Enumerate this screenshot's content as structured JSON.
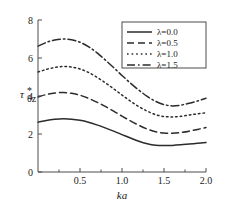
{
  "chart_data": {
    "type": "line",
    "title": "",
    "xlabel": "ka",
    "ylabel": "τ*θz",
    "xlim": [
      0.0,
      2.0
    ],
    "ylim": [
      0.0,
      8.0
    ],
    "xticks": [
      "0.5",
      "1.0",
      "1.5",
      "2.0"
    ],
    "xtick_values": [
      0.5,
      1.0,
      1.5,
      2.0
    ],
    "yticks": [
      "0",
      "2",
      "4",
      "6",
      "8"
    ],
    "ytick_values": [
      0,
      2,
      4,
      6,
      8
    ],
    "grid": false,
    "legend_position": "top-right",
    "x": [
      0.0,
      0.1,
      0.2,
      0.3,
      0.4,
      0.5,
      0.6,
      0.7,
      0.8,
      0.9,
      1.0,
      1.1,
      1.2,
      1.3,
      1.4,
      1.5,
      1.6,
      1.7,
      1.8,
      1.9,
      2.0
    ],
    "series": [
      {
        "name": "λ=0.0",
        "style": "solid",
        "values": [
          2.62,
          2.71,
          2.77,
          2.8,
          2.78,
          2.72,
          2.62,
          2.48,
          2.32,
          2.15,
          1.97,
          1.79,
          1.62,
          1.49,
          1.41,
          1.39,
          1.4,
          1.43,
          1.47,
          1.51,
          1.55
        ]
      },
      {
        "name": "λ=0.5",
        "style": "dashed",
        "values": [
          3.95,
          4.08,
          4.16,
          4.18,
          4.14,
          4.04,
          3.88,
          3.68,
          3.45,
          3.2,
          2.94,
          2.69,
          2.46,
          2.26,
          2.12,
          2.05,
          2.04,
          2.08,
          2.15,
          2.24,
          2.34
        ]
      },
      {
        "name": "λ=1.0",
        "style": "dotted",
        "values": [
          5.26,
          5.4,
          5.5,
          5.55,
          5.52,
          5.42,
          5.24,
          4.99,
          4.7,
          4.38,
          4.05,
          3.73,
          3.44,
          3.2,
          3.02,
          2.92,
          2.9,
          2.93,
          3.0,
          3.06,
          3.12
        ]
      },
      {
        "name": "λ=1.5",
        "style": "dashdot",
        "values": [
          6.62,
          6.82,
          6.95,
          7.0,
          6.96,
          6.83,
          6.6,
          6.28,
          5.9,
          5.5,
          5.08,
          4.68,
          4.31,
          3.98,
          3.72,
          3.55,
          3.48,
          3.52,
          3.62,
          3.74,
          3.88
        ]
      }
    ],
    "colors": {
      "curve": "#2b2b2b",
      "axis": "#4d4d4d",
      "text": "#1a1a1a",
      "background": "#ffffff"
    }
  },
  "legend": {
    "items": [
      {
        "label": "λ=0.0"
      },
      {
        "label": "λ=0.5"
      },
      {
        "label": "λ=1.0"
      },
      {
        "label": "λ=1.5"
      }
    ]
  },
  "axes": {
    "x_label": "ka",
    "y_label_main": "τ",
    "y_label_sup": "*",
    "y_label_sub": "θz"
  }
}
